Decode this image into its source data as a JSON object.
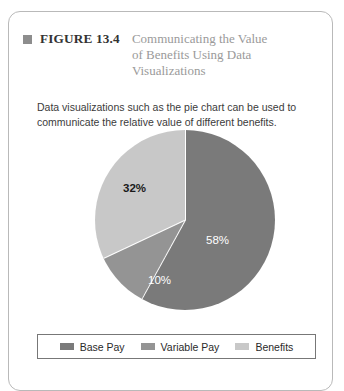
{
  "figure": {
    "bullet_icon": "square-bullet-icon",
    "number_label": "FIGURE 13.4",
    "title": "Communicating the Value of Benefits Using Data Visualizations",
    "caption": "Data visualizations such as the pie chart can be used to communicate the relative value of different benefits."
  },
  "chart_data": {
    "type": "pie",
    "title": "Communicating the Value of Benefits Using Data Visualizations",
    "categories": [
      "Base Pay",
      "Variable Pay",
      "Benefits"
    ],
    "values": [
      58,
      10,
      32
    ],
    "value_labels": [
      "58%",
      "10%",
      "32%"
    ],
    "unit": "percent",
    "colors": [
      "#7a7a7a",
      "#949494",
      "#c8c8c8"
    ],
    "label_colors": [
      "#ffffff",
      "#ffffff",
      "#1a1a1a"
    ],
    "start_angle_deg": 0,
    "direction": "clockwise",
    "slice_border_color": "#ffffff",
    "legend": {
      "position": "bottom",
      "border_color": "#777777",
      "entries": [
        {
          "label": "Base Pay",
          "color": "#7a7a7a"
        },
        {
          "label": "Variable Pay",
          "color": "#949494"
        },
        {
          "label": "Benefits",
          "color": "#c8c8c8"
        }
      ]
    },
    "grid": false,
    "xlabel": "",
    "ylabel": ""
  },
  "card": {
    "border_color": "#b9b9b9",
    "background": "#ffffff"
  }
}
